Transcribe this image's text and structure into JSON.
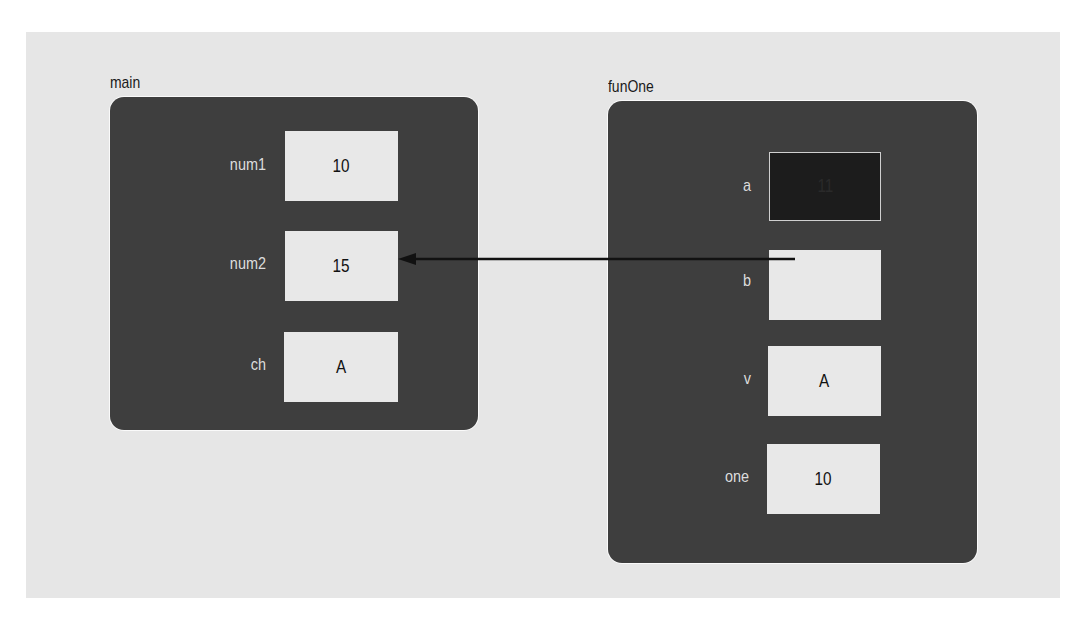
{
  "frames": [
    {
      "name": "main",
      "variables": [
        {
          "label": "num1",
          "value": "10"
        },
        {
          "label": "num2",
          "value": "15"
        },
        {
          "label": "ch",
          "value": "A"
        }
      ]
    },
    {
      "name": "funOne",
      "variables": [
        {
          "label": "a",
          "value": "11",
          "highlighted": true
        },
        {
          "label": "b",
          "value": ""
        },
        {
          "label": "v",
          "value": "A"
        },
        {
          "label": "one",
          "value": "10"
        }
      ]
    }
  ],
  "arrows": [
    {
      "from": "funOne.b",
      "to": "main.num2",
      "description": "reference parameter b refers to num2"
    }
  ],
  "colors": {
    "background": "#e6e6e6",
    "frame": "#3e3e3e",
    "cell": "#e8e8e8",
    "cell_highlighted": "#1c1c1c",
    "arrow": "#111111"
  }
}
